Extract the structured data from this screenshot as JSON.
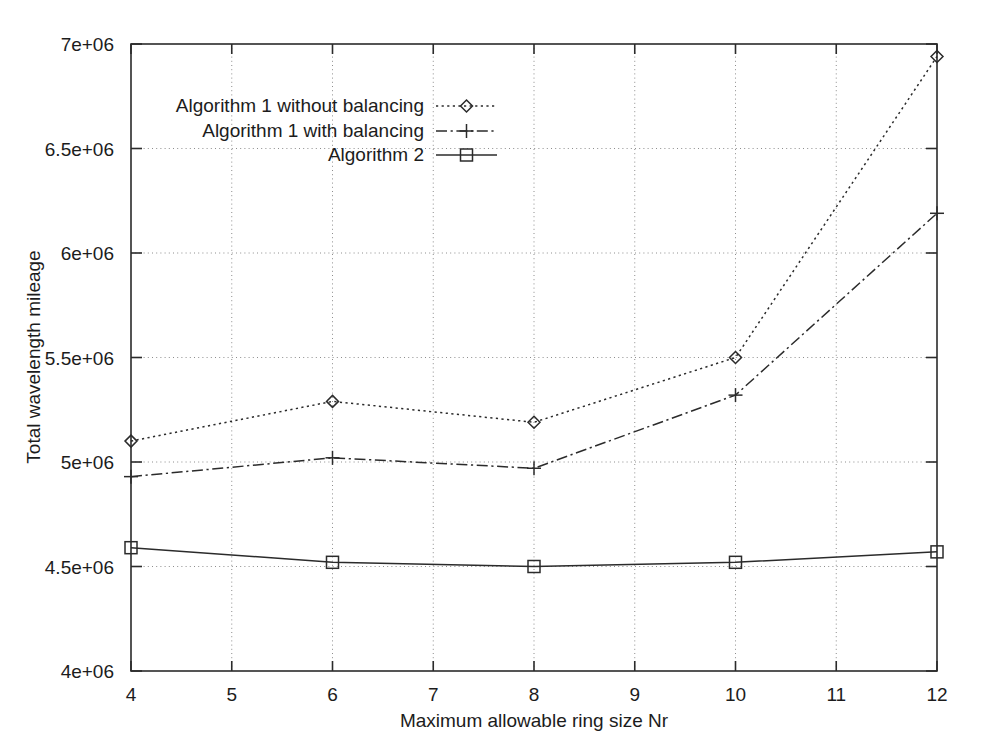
{
  "chart_data": {
    "type": "line",
    "title": "",
    "xlabel": "Maximum allowable ring size Nr",
    "ylabel": "Total wavelength mileage",
    "x": [
      4,
      6,
      8,
      10,
      12
    ],
    "xlim": [
      4,
      12
    ],
    "ylim": [
      4000000,
      7000000
    ],
    "xticks": [
      4,
      5,
      6,
      7,
      8,
      9,
      10,
      11,
      12
    ],
    "xticklabels": [
      "4",
      "5",
      "6",
      "7",
      "8",
      "9",
      "10",
      "11",
      "12"
    ],
    "yticks": [
      4000000,
      4500000,
      5000000,
      5500000,
      6000000,
      6500000,
      7000000
    ],
    "yticklabels": [
      "4e+06",
      "4.5e+06",
      "5e+06",
      "5.5e+06",
      "6e+06",
      "6.5e+06",
      "7e+06"
    ],
    "grid": true,
    "legend_position": "upper-left-inside",
    "series": [
      {
        "name": "Algorithm 1 without balancing",
        "marker": "diamond",
        "linestyle": "dotted",
        "color": "#2b2b2b",
        "values": [
          5100000,
          5290000,
          5190000,
          5500000,
          6940000
        ]
      },
      {
        "name": "Algorithm 1 with balancing",
        "marker": "plus",
        "linestyle": "dash-dot",
        "color": "#2b2b2b",
        "values": [
          4930000,
          5020000,
          4970000,
          5320000,
          6190000
        ]
      },
      {
        "name": "Algorithm 2",
        "marker": "square",
        "linestyle": "solid",
        "color": "#2b2b2b",
        "values": [
          4590000,
          4520000,
          4500000,
          4520000,
          4570000
        ]
      }
    ]
  },
  "axes": {
    "x_axis_title": "Maximum allowable ring size Nr",
    "y_axis_title": "Total wavelength mileage"
  },
  "legend": {
    "entries": [
      {
        "label": "Algorithm 1 without balancing",
        "marker": "diamond-icon"
      },
      {
        "label": "Algorithm 1 with balancing",
        "marker": "plus-icon"
      },
      {
        "label": "Algorithm 2",
        "marker": "square-icon"
      }
    ]
  },
  "colors": {
    "ink": "#2b2b2b",
    "grid": "#8d8d8d",
    "background": "#ffffff"
  }
}
